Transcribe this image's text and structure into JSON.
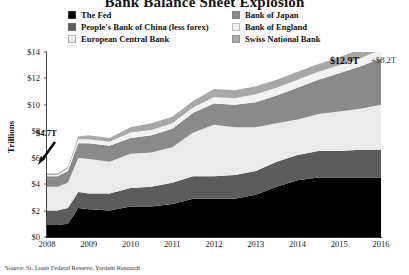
{
  "title": "Bank Balance Sheet Explosion",
  "legend": {
    "left": [
      {
        "label": "The Fed",
        "color": "#000000"
      },
      {
        "label": "People's Bank of China (less forex)",
        "color": "#5c5c5c"
      },
      {
        "label": "European Central Bank",
        "color": "#ebebeb"
      }
    ],
    "right": [
      {
        "label": "Bank of Japan",
        "color": "#8a8a8a"
      },
      {
        "label": "Bank of England",
        "color": "#f2f2f2"
      },
      {
        "label": "Swiss National Bank",
        "color": "#a8a8a8"
      }
    ]
  },
  "axis": {
    "y_title": "Trillions",
    "y_ticks": [
      "$0",
      "$2",
      "$4",
      "$6",
      "$8",
      "$10",
      "$12",
      "$14"
    ],
    "x_ticks": [
      "2008",
      "2009",
      "2010",
      "2011",
      "2012",
      "2013",
      "2014",
      "2015",
      "2016"
    ]
  },
  "annotations": {
    "start_value": "$4.7T",
    "end_value": "$12.9T",
    "delta_value": "+$8.2T"
  },
  "source": "Source: St. Louis Federal Reserve, Yardeni Research",
  "chart_data": {
    "type": "area",
    "title": "Bank Balance Sheet Explosion",
    "xlabel": "",
    "ylabel": "Trillions",
    "ylim": [
      0,
      14
    ],
    "xlim": [
      2008,
      2016
    ],
    "grid": false,
    "legend_position": "top",
    "stacked": true,
    "annotations": [
      {
        "text": "$4.7T",
        "x": 2008.0,
        "y": 4.7
      },
      {
        "text": "$12.9T",
        "x": 2016.0,
        "y": 12.9
      },
      {
        "text": "+$8.2T",
        "x": 2016.0,
        "y": 12.9
      }
    ],
    "x": [
      2008.0,
      2008.25,
      2008.5,
      2008.75,
      2009.0,
      2009.5,
      2010.0,
      2010.5,
      2011.0,
      2011.5,
      2012.0,
      2012.5,
      2013.0,
      2013.5,
      2014.0,
      2014.5,
      2015.0,
      2015.5,
      2016.0
    ],
    "series": [
      {
        "name": "The Fed",
        "color": "#000000",
        "values": [
          0.9,
          0.9,
          1.0,
          2.2,
          2.1,
          2.0,
          2.3,
          2.3,
          2.5,
          2.9,
          2.9,
          2.9,
          3.2,
          3.8,
          4.3,
          4.5,
          4.5,
          4.5,
          4.5
        ]
      },
      {
        "name": "People's Bank of China (less forex)",
        "color": "#5c5c5c",
        "values": [
          1.1,
          1.1,
          1.2,
          1.2,
          1.2,
          1.3,
          1.4,
          1.5,
          1.6,
          1.7,
          1.7,
          1.8,
          1.8,
          1.9,
          1.9,
          2.0,
          2.0,
          2.1,
          2.1
        ]
      },
      {
        "name": "European Central Bank",
        "color": "#ebebeb",
        "values": [
          1.8,
          1.8,
          1.9,
          2.6,
          2.6,
          2.4,
          2.6,
          2.6,
          2.7,
          3.3,
          3.9,
          3.6,
          3.3,
          2.9,
          2.7,
          2.8,
          3.0,
          3.1,
          3.4
        ]
      },
      {
        "name": "Bank of Japan",
        "color": "#8a8a8a",
        "values": [
          0.8,
          0.8,
          0.9,
          1.1,
          1.2,
          1.2,
          1.2,
          1.3,
          1.4,
          1.5,
          1.6,
          1.7,
          1.9,
          2.1,
          2.4,
          2.6,
          2.9,
          3.2,
          3.5
        ]
      },
      {
        "name": "Bank of England",
        "color": "#f2f2f2",
        "values": [
          0.1,
          0.1,
          0.2,
          0.3,
          0.3,
          0.3,
          0.4,
          0.4,
          0.4,
          0.4,
          0.5,
          0.5,
          0.6,
          0.6,
          0.6,
          0.6,
          0.6,
          0.6,
          0.7
        ]
      },
      {
        "name": "Swiss National Bank",
        "color": "#a8a8a8",
        "values": [
          0.1,
          0.1,
          0.1,
          0.2,
          0.3,
          0.3,
          0.4,
          0.5,
          0.5,
          0.5,
          0.6,
          0.6,
          0.6,
          0.6,
          0.6,
          0.6,
          0.6,
          0.7,
          0.7
        ]
      }
    ]
  }
}
